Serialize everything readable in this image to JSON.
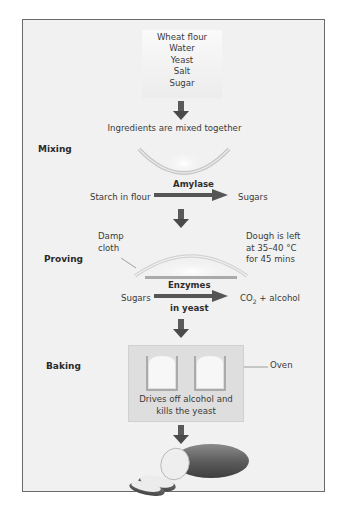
{
  "diagram": {
    "ingredients": [
      "Wheat flour",
      "Water",
      "Yeast",
      "Salt",
      "Sugar"
    ],
    "mix_caption": "Ingredients are mixed together",
    "stages": {
      "mixing": {
        "label": "Mixing",
        "reactant": "Starch in flour",
        "enzyme": "Amylase",
        "product": "Sugars"
      },
      "proving": {
        "label": "Proving",
        "cloth_label_line1": "Damp",
        "cloth_label_line2": "cloth",
        "conditions_line1": "Dough is left",
        "conditions_line2": "at 35–40 °C",
        "conditions_line3": "for 45 mins",
        "reactant": "Sugars",
        "enzyme_line1": "Enzymes",
        "enzyme_line2": "in yeast",
        "product_prefix": "CO",
        "product_subscript": "2",
        "product_suffix": " + alcohol"
      },
      "baking": {
        "label": "Baking",
        "oven_label": "Oven",
        "caption_line1": "Drives off alcohol and",
        "caption_line2": "kills the yeast"
      }
    },
    "colors": {
      "frame_border": "#6a6a6a",
      "panel_bg": "#f1f1f1",
      "arrow": "#555555",
      "oven_bg": "#dedede",
      "bowl_stroke": "#b8b8b8",
      "tray": "#aaaaaa",
      "bread_crust": "#5a5a5a"
    },
    "icons": [
      "down-arrow-icon",
      "right-arrow-icon",
      "bowl-icon",
      "dough-tray-icon",
      "bread-tin-icon",
      "bread-loaf-icon"
    ]
  }
}
